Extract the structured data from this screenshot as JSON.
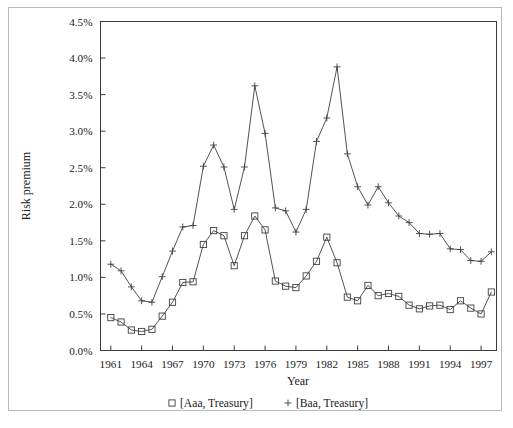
{
  "figure": {
    "background_color": "#ffffff",
    "line_color": "#404040",
    "frame_color": "#3a3a3a"
  },
  "chart_data": {
    "type": "line",
    "title": "",
    "xlabel": "Year",
    "ylabel": "Risk premium",
    "xlim": [
      1960,
      1998.5
    ],
    "ylim": [
      0.0,
      4.5
    ],
    "grid": false,
    "legend_position": "bottom",
    "y_ticks": [
      0.0,
      0.5,
      1.0,
      1.5,
      2.0,
      2.5,
      3.0,
      3.5,
      4.0,
      4.5
    ],
    "y_tick_labels": [
      "0.0%",
      "0.5%",
      "1.0%",
      "1.5%",
      "2.0%",
      "2.5%",
      "3.0%",
      "3.5%",
      "4.0%",
      "4.5%"
    ],
    "x_ticks": [
      1961,
      1964,
      1967,
      1970,
      1973,
      1976,
      1979,
      1982,
      1985,
      1988,
      1991,
      1994,
      1997
    ],
    "x_tick_labels": [
      "1961",
      "1964",
      "1967",
      "1970",
      "1973",
      "1976",
      "1979",
      "1982",
      "1985",
      "1988",
      "1991",
      "1994",
      "1997"
    ],
    "x": [
      1961,
      1962,
      1963,
      1964,
      1965,
      1966,
      1967,
      1968,
      1969,
      1970,
      1971,
      1972,
      1973,
      1974,
      1975,
      1976,
      1977,
      1978,
      1979,
      1980,
      1981,
      1982,
      1983,
      1984,
      1985,
      1986,
      1987,
      1988,
      1989,
      1990,
      1991,
      1992,
      1993,
      1994,
      1995,
      1996,
      1997,
      1998
    ],
    "series": [
      {
        "name": "[Aaa, Treasury]",
        "marker": "square",
        "values": [
          0.45,
          0.39,
          0.28,
          0.26,
          0.29,
          0.47,
          0.66,
          0.93,
          0.94,
          1.45,
          1.64,
          1.57,
          1.16,
          1.57,
          1.84,
          1.65,
          0.95,
          0.88,
          0.86,
          1.02,
          1.22,
          1.55,
          1.2,
          0.73,
          0.68,
          0.89,
          0.75,
          0.78,
          0.74,
          0.62,
          0.57,
          0.61,
          0.62,
          0.56,
          0.68,
          0.58,
          0.5,
          0.8
        ]
      },
      {
        "name": "[Baa, Treasury]",
        "marker": "plus",
        "values": [
          1.18,
          1.09,
          0.87,
          0.68,
          0.66,
          1.01,
          1.36,
          1.69,
          1.71,
          2.52,
          2.81,
          2.51,
          1.93,
          2.51,
          3.62,
          2.97,
          1.95,
          1.91,
          1.62,
          1.93,
          2.86,
          3.18,
          3.88,
          2.69,
          2.24,
          1.99,
          2.24,
          2.02,
          1.84,
          1.75,
          1.6,
          1.59,
          1.6,
          1.39,
          1.38,
          1.23,
          1.22,
          1.35
        ]
      }
    ]
  },
  "legend": {
    "entries": [
      {
        "marker": "square",
        "label": "[Aaa, Treasury]"
      },
      {
        "marker": "plus",
        "label": "[Baa, Treasury]"
      }
    ]
  }
}
